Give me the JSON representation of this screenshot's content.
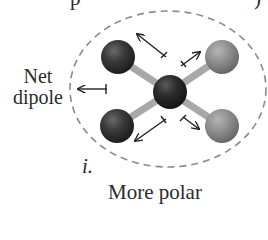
{
  "figure": {
    "top_cut_text_left": "p",
    "top_cut_text_right": ")",
    "net_dipole_label_line1": "Net",
    "net_dipole_label_line2": "dipole",
    "panel_number": "i.",
    "caption": "More polar"
  },
  "molecule": {
    "central_atom": {
      "color": "#2e2e2e"
    },
    "atoms": [
      {
        "position": "top-left",
        "color": "#3c3c3c"
      },
      {
        "position": "top-right",
        "color": "#8f8f8f"
      },
      {
        "position": "bottom-left",
        "color": "#3c3c3c"
      },
      {
        "position": "bottom-right",
        "color": "#8f8f8f"
      }
    ],
    "bond_color": "#b0b0b0",
    "boundary": "dashed-ellipse"
  }
}
